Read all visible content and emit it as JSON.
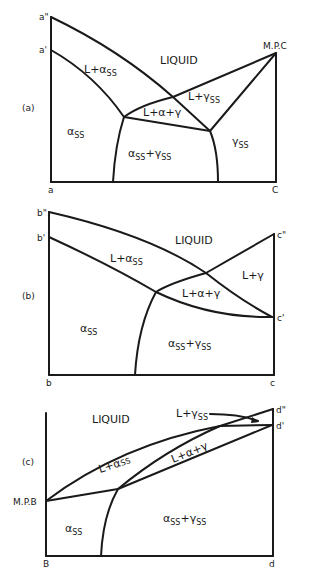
{
  "diagrams": [
    {
      "id": "a",
      "panel_label": "(a)",
      "corner_labels": {
        "top_left_upper": "a\"",
        "top_left_lower": "a'",
        "top_right": "M.P.C",
        "bottom_left": "a",
        "bottom_right": "C"
      },
      "regions": {
        "liquid": "LIQUID",
        "l_alpha": "L+α",
        "l_alpha_sub": "SS",
        "l_gamma": "L+γ",
        "l_gamma_sub": "SS",
        "l_alpha_gamma": "L+α+γ",
        "alpha": "α",
        "alpha_sub": "SS",
        "alpha_gamma": "α",
        "alpha_gamma_sub1": "SS",
        "alpha_gamma_mid": "+γ",
        "alpha_gamma_sub2": "SS",
        "gamma": "γ",
        "gamma_sub": "SS"
      }
    },
    {
      "id": "b",
      "panel_label": "(b)",
      "corner_labels": {
        "top_left_upper": "b\"",
        "top_left_lower": "b'",
        "top_right_upper": "c\"",
        "right_lower": "c'",
        "bottom_left": "b",
        "bottom_right": "c"
      },
      "regions": {
        "liquid": "LIQUID",
        "l_alpha": "L+α",
        "l_alpha_sub": "SS",
        "l_gamma": "L+γ",
        "l_alpha_gamma": "L+α+γ",
        "alpha": "α",
        "alpha_sub": "SS",
        "alpha_gamma": "α",
        "alpha_gamma_sub1": "SS",
        "alpha_gamma_mid": "+γ",
        "alpha_gamma_sub2": "SS"
      }
    },
    {
      "id": "c",
      "panel_label": "(c)",
      "corner_labels": {
        "left_mid": "M.P.B",
        "top_right_upper": "d\"",
        "top_right_lower": "d'",
        "bottom_left": "B",
        "bottom_right": "d"
      },
      "regions": {
        "liquid": "LIQUID",
        "l_gamma": "L+γ",
        "l_gamma_sub": "SS",
        "l_alpha": "L+α",
        "l_alpha_sub": "SS",
        "l_alpha_gamma": "L+α+γ",
        "alpha": "α",
        "alpha_sub": "SS",
        "alpha_gamma": "α",
        "alpha_gamma_sub1": "SS",
        "alpha_gamma_mid": "+γ",
        "alpha_gamma_sub2": "SS"
      }
    }
  ]
}
